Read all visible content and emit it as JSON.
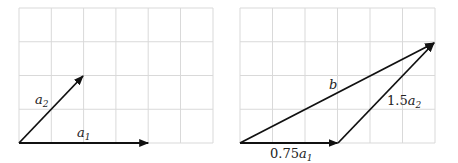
{
  "panels": [
    {
      "name": "basis-vectors",
      "grid": {
        "x0": 19,
        "y0": 8,
        "cols": 6,
        "rows": 4,
        "cell_w": 32.3,
        "cell_h": 33.75
      },
      "vectors": [
        {
          "label": "a",
          "sub": "1",
          "from": [
            0,
            0
          ],
          "to": [
            4,
            0
          ]
        },
        {
          "label": "a",
          "sub": "2",
          "from": [
            0,
            0
          ],
          "to": [
            2,
            2
          ]
        }
      ]
    },
    {
      "name": "linear-combination",
      "grid": {
        "x0": 240,
        "y0": 8,
        "cols": 6,
        "rows": 4,
        "cell_w": 32.5,
        "cell_h": 33.75
      },
      "vectors": [
        {
          "label": "0.75a",
          "coef": "0.75",
          "sub": "1",
          "from": [
            0,
            0
          ],
          "to": [
            3,
            0
          ]
        },
        {
          "label": "1.5a",
          "coef": "1.5",
          "sub": "2",
          "from": [
            3,
            0
          ],
          "to": [
            6,
            3
          ]
        },
        {
          "label": "b",
          "from": [
            0,
            0
          ],
          "to": [
            6,
            3
          ]
        }
      ]
    }
  ],
  "labels": {
    "a1_var": "a",
    "a1_sub": "1",
    "a2_var": "a",
    "a2_sub": "2",
    "c1_coef": "0.75",
    "c1_var": "a",
    "c1_sub": "1",
    "c2_coef": "1.5",
    "c2_var": "a",
    "c2_sub": "2",
    "b_var": "b"
  },
  "colors": {
    "grid": "#d9d9d9",
    "vector": "#111111"
  }
}
